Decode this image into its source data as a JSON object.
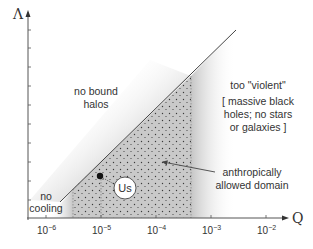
{
  "diagram": {
    "y_axis_label": "Λ",
    "x_axis_label": "Q",
    "x_ticks": [
      {
        "base": "10",
        "exp": "−6"
      },
      {
        "base": "10",
        "exp": "−5"
      },
      {
        "base": "10",
        "exp": "−4"
      },
      {
        "base": "10",
        "exp": "−3"
      },
      {
        "base": "10",
        "exp": "−2"
      }
    ],
    "regions": {
      "no_bound_halos": [
        "no bound",
        "halos"
      ],
      "too_violent": "too \"violent\"",
      "too_violent_note": [
        "[ massive black",
        "holes; no stars",
        "or galaxies ]"
      ],
      "no_cooling": [
        "no",
        "cooling"
      ],
      "allowed": [
        "anthropically",
        "allowed domain"
      ]
    },
    "marker": {
      "label": "Us"
    },
    "colors": {
      "axis": "#555555",
      "boundary_line": "#444444",
      "stipple_fill": "#c8c8c8",
      "stipple_dot": "#333333",
      "text": "#333333"
    }
  }
}
